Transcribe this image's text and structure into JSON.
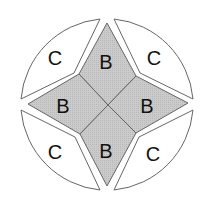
{
  "diagram": {
    "type": "four-point-star-in-circle",
    "colors": {
      "background": "#ffffff",
      "outline": "#555555",
      "b_fill": "#c8c8c8",
      "c_fill": "#ffffff",
      "text": "#111111"
    },
    "regions": {
      "b_top": {
        "label": "B"
      },
      "b_left": {
        "label": "B"
      },
      "b_right": {
        "label": "B"
      },
      "b_bottom": {
        "label": "B"
      },
      "c_top_left": {
        "label": "C"
      },
      "c_top_right": {
        "label": "C"
      },
      "c_bottom_left": {
        "label": "C"
      },
      "c_bottom_right": {
        "label": "C"
      }
    }
  }
}
